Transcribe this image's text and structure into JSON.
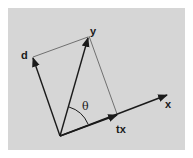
{
  "diagram": {
    "type": "vector-projection",
    "background_color": "#d6d6d6",
    "stroke_color": "#1a1a1a",
    "thin_line_color": "#555555",
    "origin": [
      60,
      136
    ],
    "vectors": [
      {
        "name": "d",
        "label": "d",
        "tip": [
          33,
          57
        ]
      },
      {
        "name": "y",
        "label": "y",
        "tip": [
          88,
          37
        ]
      },
      {
        "name": "x",
        "label": "x",
        "tip": [
          167,
          95
        ]
      },
      {
        "name": "tx",
        "label": "tx",
        "tip": [
          117,
          115
        ]
      }
    ],
    "angle_label": "θ",
    "labels": {
      "d": "d",
      "y": "y",
      "x": "x",
      "tx": "tx",
      "theta": "θ"
    }
  }
}
